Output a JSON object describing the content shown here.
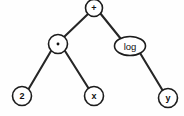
{
  "figure": {
    "kind": "expression-tree-diagram",
    "background_color": "#fefefe",
    "stroke_color": "#1c1c1c",
    "edge_color": "#262626",
    "label_color": "#111111",
    "width": 184,
    "height": 116
  },
  "nodes": [
    {
      "id": "root",
      "label": "+",
      "icon": "plus-operator-glyph",
      "shape": "circle",
      "cx": 94,
      "cy": 8,
      "rx": 8.5,
      "ry": 8.5,
      "label_style": "label-op",
      "role": "operator",
      "depth": 0
    },
    {
      "id": "times",
      "label": "·",
      "icon": "multiplication-dot-glyph",
      "shape": "circle",
      "cx": 58,
      "cy": 44,
      "rx": 9.5,
      "ry": 9.5,
      "label_style": "label-op",
      "role": "operator",
      "depth": 1
    },
    {
      "id": "log",
      "label": "log",
      "icon": "log-function-label",
      "shape": "ellipse",
      "cx": 130,
      "cy": 46,
      "rx": 15.5,
      "ry": 9.5,
      "label_style": "label-word",
      "role": "function",
      "depth": 1
    },
    {
      "id": "two",
      "label": "2",
      "icon": "constant-two-glyph",
      "shape": "circle",
      "cx": 22,
      "cy": 96,
      "rx": 9.5,
      "ry": 9.5,
      "label_style": "label-leaf",
      "role": "constant",
      "depth": 2
    },
    {
      "id": "x",
      "label": "x",
      "icon": "variable-x-glyph",
      "shape": "circle",
      "cx": 94,
      "cy": 96,
      "rx": 9.5,
      "ry": 9.5,
      "label_style": "label-leaf",
      "role": "variable",
      "depth": 2
    },
    {
      "id": "y",
      "label": "y",
      "icon": "variable-y-glyph",
      "shape": "circle",
      "cx": 168,
      "cy": 98,
      "rx": 9.5,
      "ry": 9.5,
      "label_style": "label-leaf",
      "role": "variable",
      "depth": 2
    }
  ],
  "edges": [
    {
      "id": "root-times",
      "from": "root",
      "to": "times",
      "x1": 88,
      "y1": 14,
      "x2": 64,
      "y2": 37
    },
    {
      "id": "root-log",
      "from": "root",
      "to": "log",
      "x1": 100,
      "y1": 13,
      "x2": 121,
      "y2": 39
    },
    {
      "id": "times-two",
      "from": "times",
      "to": "two",
      "x1": 51,
      "y1": 51,
      "x2": 28,
      "y2": 90
    },
    {
      "id": "times-x",
      "from": "times",
      "to": "x",
      "x1": 65,
      "y1": 51,
      "x2": 89,
      "y2": 89
    },
    {
      "id": "log-y",
      "from": "log",
      "to": "y",
      "x1": 140,
      "y1": 53,
      "x2": 163,
      "y2": 91
    }
  ],
  "expression": {
    "infix": "2 · x + log y",
    "root_operator": "+",
    "left_subtree": "2 · x",
    "right_subtree": "log y"
  }
}
